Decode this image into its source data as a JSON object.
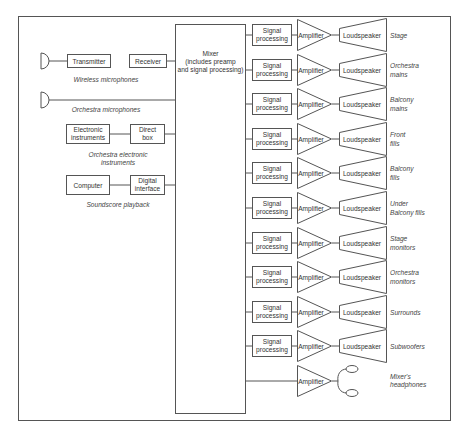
{
  "diagram": {
    "mixer": {
      "lines": [
        "Mixer",
        "(includes preamp",
        "and signal processing)"
      ]
    },
    "inputs": {
      "wireless": {
        "transmitter": "Transmitter",
        "receiver": "Receiver",
        "caption": "Wireless microphones"
      },
      "orchestra_mics": {
        "caption": "Orchestra microphones"
      },
      "electronic": {
        "source_lines": [
          "Electronic",
          "instruments"
        ],
        "direct_box_lines": [
          "Direct",
          "box"
        ],
        "caption_lines": [
          "Orchestra electronic",
          "instruments"
        ]
      },
      "soundscore": {
        "source": "Computer",
        "interface_lines": [
          "Digital",
          "interface"
        ],
        "caption": "Soundscore playback"
      }
    },
    "labels": {
      "signal_processing": [
        "Signal",
        "processing"
      ],
      "amplifier": "Amplifier",
      "loudspeaker": "Loudspeaker"
    },
    "outputs": [
      {
        "name_lines": [
          "Stage"
        ]
      },
      {
        "name_lines": [
          "Orchestra",
          "mains"
        ]
      },
      {
        "name_lines": [
          "Balcony",
          "mains"
        ]
      },
      {
        "name_lines": [
          "Front",
          "fills"
        ]
      },
      {
        "name_lines": [
          "Balcony",
          "fills"
        ]
      },
      {
        "name_lines": [
          "Under",
          "Balcony fills"
        ]
      },
      {
        "name_lines": [
          "Stage",
          "monitors"
        ]
      },
      {
        "name_lines": [
          "Orchestra",
          "monitors"
        ]
      },
      {
        "name_lines": [
          "Surrounds"
        ]
      },
      {
        "name_lines": [
          "Subwoofers"
        ]
      }
    ],
    "headphones": {
      "amplifier": "Amplifier",
      "name_lines": [
        "Mixer's",
        "headphones"
      ]
    },
    "colors": {
      "stroke": "#555555",
      "text": "#333333",
      "background": "#ffffff"
    }
  }
}
